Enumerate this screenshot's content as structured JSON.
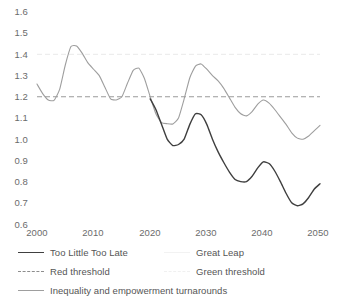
{
  "chart_data": {
    "type": "line",
    "title": "",
    "xlabel": "",
    "ylabel": "",
    "xlim": [
      2000,
      2050
    ],
    "ylim": [
      0.6,
      1.6
    ],
    "grid": false,
    "legend_position": "bottom-left",
    "x_ticks": [
      "2000",
      "2010",
      "2020",
      "2030",
      "2040",
      "2050"
    ],
    "y_ticks": [
      "1.6",
      "1.5",
      "1.4",
      "1.3",
      "1.2",
      "1.1",
      "1.0",
      "0.9",
      "0.8",
      "0.7",
      "0.6"
    ],
    "thresholds": [
      {
        "name": "Red threshold",
        "value": 1.2,
        "color": "#8d8d8d",
        "style": "dashed"
      },
      {
        "name": "Green threshold",
        "value": 1.4,
        "color": "#efefef",
        "style": "dashed"
      }
    ],
    "series": [
      {
        "name": "Too Little Too Late",
        "color": "#3f3f3f",
        "style": "solid",
        "x": [
          2020,
          2021,
          2022,
          2023,
          2024,
          2025,
          2026,
          2027,
          2028,
          2029,
          2030,
          2031,
          2032,
          2033,
          2034,
          2035,
          2036,
          2037,
          2038,
          2039,
          2040,
          2041,
          2042,
          2043,
          2044,
          2045,
          2046,
          2047,
          2048,
          2049,
          2050
        ],
        "values": [
          1.19,
          1.14,
          1.07,
          1.0,
          0.97,
          0.975,
          1.0,
          1.07,
          1.12,
          1.115,
          1.07,
          1.0,
          0.94,
          0.89,
          0.845,
          0.81,
          0.8,
          0.8,
          0.825,
          0.865,
          0.893,
          0.885,
          0.85,
          0.8,
          0.745,
          0.7,
          0.686,
          0.695,
          0.725,
          0.765,
          0.79
        ]
      },
      {
        "name": "Great Leap",
        "color": "#fbfbfb",
        "style": "solid",
        "x": [],
        "values": []
      },
      {
        "name": "Inequality and empowerment turnarounds",
        "color": "#9e9e9e",
        "style": "solid",
        "x": [
          2000,
          2001,
          2002,
          2003,
          2004,
          2005,
          2006,
          2007,
          2008,
          2009,
          2010,
          2011,
          2012,
          2013,
          2014,
          2015,
          2016,
          2017,
          2018,
          2019,
          2020,
          2021,
          2022,
          2023,
          2024,
          2025,
          2026,
          2027,
          2028,
          2029,
          2030,
          2031,
          2032,
          2033,
          2034,
          2035,
          2036,
          2037,
          2038,
          2039,
          2040,
          2041,
          2042,
          2043,
          2044,
          2045,
          2046,
          2047,
          2048,
          2049,
          2050
        ],
        "values": [
          1.26,
          1.215,
          1.185,
          1.183,
          1.235,
          1.35,
          1.437,
          1.44,
          1.405,
          1.36,
          1.33,
          1.3,
          1.245,
          1.19,
          1.185,
          1.2,
          1.265,
          1.325,
          1.335,
          1.285,
          1.2,
          1.12,
          1.078,
          1.073,
          1.072,
          1.1,
          1.19,
          1.29,
          1.345,
          1.355,
          1.33,
          1.3,
          1.275,
          1.24,
          1.195,
          1.15,
          1.12,
          1.11,
          1.13,
          1.165,
          1.185,
          1.17,
          1.14,
          1.105,
          1.07,
          1.03,
          1.005,
          1.0,
          1.015,
          1.04,
          1.065
        ]
      }
    ]
  },
  "legend": {
    "rows": [
      [
        {
          "label": "Too Little Too Late",
          "swatch": "solid-dark"
        },
        {
          "label": "Great Leap",
          "swatch": "solid-faint"
        }
      ],
      [
        {
          "label": "Red threshold",
          "swatch": "dash-dark"
        },
        {
          "label": "Green threshold",
          "swatch": "dash-faint"
        }
      ],
      [
        {
          "label": "Inequality and empowerment turnarounds",
          "swatch": "solid-gray"
        }
      ]
    ]
  },
  "axes": {
    "y_labels": [
      "1.6",
      "1.5",
      "1.4",
      "1.3",
      "1.2",
      "1.1",
      "1.0",
      "0.9",
      "0.8",
      "0.7",
      "0.6"
    ],
    "x_labels": [
      "2000",
      "2010",
      "2020",
      "2030",
      "2040",
      "2050"
    ]
  }
}
